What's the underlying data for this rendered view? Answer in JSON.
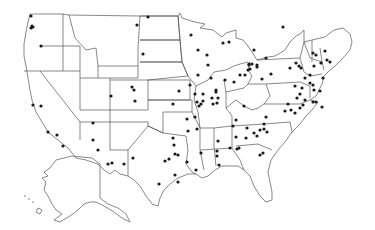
{
  "map": {
    "title": "",
    "region": "United States",
    "style": {
      "stroke": "#555555",
      "dot": "#1a1a1a",
      "background": "#ffffff"
    },
    "points": [
      [
        31,
        16
      ],
      [
        32,
        26
      ],
      [
        33,
        27
      ],
      [
        31,
        28
      ],
      [
        41,
        46
      ],
      [
        148,
        17
      ],
      [
        137,
        25
      ],
      [
        143,
        54
      ],
      [
        111,
        96
      ],
      [
        132,
        87
      ],
      [
        134,
        90
      ],
      [
        135,
        101
      ],
      [
        33,
        105
      ],
      [
        41,
        106
      ],
      [
        48,
        132
      ],
      [
        57,
        135
      ],
      [
        63,
        146
      ],
      [
        93,
        123
      ],
      [
        93,
        140
      ],
      [
        98,
        150
      ],
      [
        179,
        91
      ],
      [
        190,
        85
      ],
      [
        173,
        104
      ],
      [
        187,
        119
      ],
      [
        195,
        117
      ],
      [
        197,
        129
      ],
      [
        188,
        131
      ],
      [
        173,
        138
      ],
      [
        175,
        154
      ],
      [
        165,
        161
      ],
      [
        169,
        159
      ],
      [
        175,
        175
      ],
      [
        174,
        145
      ],
      [
        178,
        182
      ],
      [
        159,
        184
      ],
      [
        133,
        158
      ],
      [
        108,
        164
      ],
      [
        112,
        163
      ],
      [
        124,
        164
      ],
      [
        197,
        102
      ],
      [
        199,
        106
      ],
      [
        178,
        155
      ],
      [
        196,
        170
      ],
      [
        219,
        165
      ],
      [
        218,
        141
      ],
      [
        187,
        162
      ],
      [
        236,
        120
      ],
      [
        201,
        153
      ],
      [
        217,
        151
      ],
      [
        217,
        156
      ],
      [
        230,
        148
      ],
      [
        236,
        137
      ],
      [
        237,
        149
      ],
      [
        254,
        133
      ],
      [
        257,
        136
      ],
      [
        246,
        138
      ],
      [
        260,
        130
      ],
      [
        264,
        124
      ],
      [
        267,
        132
      ],
      [
        217,
        103
      ],
      [
        233,
        126
      ],
      [
        247,
        128
      ],
      [
        203,
        101
      ],
      [
        195,
        94
      ],
      [
        203,
        94
      ],
      [
        201,
        104
      ],
      [
        213,
        104
      ],
      [
        216,
        92
      ],
      [
        212,
        98
      ],
      [
        244,
        106
      ],
      [
        257,
        67
      ],
      [
        262,
        79
      ],
      [
        271,
        74
      ],
      [
        285,
        111
      ],
      [
        288,
        104
      ],
      [
        295,
        113
      ],
      [
        291,
        110
      ],
      [
        300,
        108
      ],
      [
        313,
        102
      ],
      [
        316,
        102
      ],
      [
        322,
        107
      ],
      [
        295,
        86
      ],
      [
        302,
        88
      ],
      [
        297,
        98
      ],
      [
        300,
        94
      ],
      [
        305,
        100
      ],
      [
        303,
        105
      ],
      [
        305,
        78
      ],
      [
        310,
        75
      ],
      [
        310,
        83
      ],
      [
        313,
        85
      ],
      [
        314,
        90
      ],
      [
        320,
        91
      ],
      [
        323,
        78
      ],
      [
        330,
        62
      ],
      [
        290,
        68
      ],
      [
        296,
        63
      ],
      [
        299,
        66
      ],
      [
        301,
        68
      ],
      [
        325,
        51
      ],
      [
        321,
        63
      ],
      [
        314,
        66
      ],
      [
        313,
        53
      ],
      [
        316,
        55
      ],
      [
        327,
        60
      ],
      [
        283,
        27
      ],
      [
        191,
        35
      ],
      [
        198,
        50
      ],
      [
        207,
        55
      ],
      [
        223,
        43
      ],
      [
        229,
        42
      ],
      [
        249,
        64
      ],
      [
        250,
        69
      ],
      [
        252,
        64
      ],
      [
        266,
        58
      ],
      [
        254,
        50
      ],
      [
        249,
        65
      ],
      [
        257,
        65
      ],
      [
        198,
        75
      ],
      [
        208,
        65
      ],
      [
        216,
        90
      ],
      [
        218,
        98
      ],
      [
        211,
        78
      ],
      [
        225,
        80
      ],
      [
        234,
        82
      ],
      [
        240,
        75
      ],
      [
        245,
        75
      ],
      [
        248,
        70
      ],
      [
        266,
        117
      ],
      [
        264,
        129
      ],
      [
        263,
        153
      ],
      [
        239,
        148
      ],
      [
        260,
        155
      ]
    ]
  }
}
